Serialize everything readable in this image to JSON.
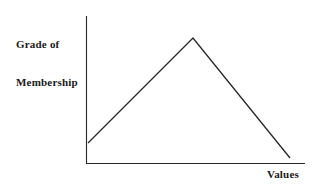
{
  "figure": {
    "background_color": "#ffffff",
    "line_color": "#262626",
    "text_color": "#1a1a1a"
  },
  "labels": {
    "y_axis_line1": "Grade of",
    "y_axis_line2": "Membership",
    "x_axis": "Values"
  },
  "chart_data": {
    "type": "line",
    "title": "",
    "subtitle": "",
    "xlabel": "Values",
    "ylabel": "Grade of Membership",
    "grid": false,
    "legend": null,
    "xlim": [
      0,
      1
    ],
    "ylim": [
      0,
      1
    ],
    "xticks": [],
    "yticks": [],
    "xticklabels": [],
    "yticklabels": [],
    "annotations": [],
    "series": [
      {
        "name": "Triangular membership function",
        "x": [
          0.01,
          0.49,
          0.94
        ],
        "y": [
          0.14,
          1.0,
          0.04
        ],
        "points_px": [
          [
            88,
            143
          ],
          [
            193,
            38
          ],
          [
            290,
            158
          ]
        ],
        "color": "#262626",
        "linewidth": 1.3
      }
    ],
    "axes_px": {
      "y_axis": {
        "x": 86,
        "y_top": 16,
        "y_bottom": 163
      },
      "x_axis": {
        "y": 163,
        "x_left": 86,
        "x_right": 305
      }
    }
  }
}
